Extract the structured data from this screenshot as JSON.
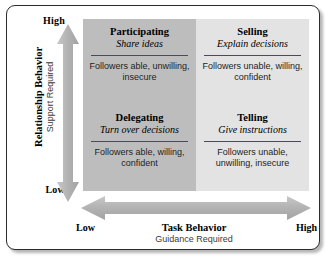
{
  "diagram": {
    "colors": {
      "quadrant_dark": "#bdbdbd",
      "quadrant_light": "#e3e3e3",
      "arrow_fill": "#b0b0b0",
      "rule": "#4a4a5a",
      "frame_border": "#2b2b2b",
      "text": "#000000"
    }
  },
  "y_axis": {
    "high_label": "High",
    "low_label": "Low",
    "caption_main": "Relationship Behavior",
    "caption_sub": "Support Required",
    "arrow_icon": "double-headed-vertical-arrow"
  },
  "x_axis": {
    "low_label": "Low",
    "high_label": "High",
    "caption_main": "Task Behavior",
    "caption_sub": "Guidance Required",
    "arrow_icon": "double-headed-horizontal-arrow"
  },
  "quadrants": [
    {
      "key": "participating",
      "title": "Participating",
      "subtitle": "Share ideas",
      "description": "Followers able, unwilling, insecure",
      "shade": "dark"
    },
    {
      "key": "selling",
      "title": "Selling",
      "subtitle": "Explain decisions",
      "description": "Followers unable, willing, confident",
      "shade": "light"
    },
    {
      "key": "delegating",
      "title": "Delegating",
      "subtitle": "Turn over decisions",
      "description": "Followers able, willing, confident",
      "shade": "dark"
    },
    {
      "key": "telling",
      "title": "Telling",
      "subtitle": "Give instructions",
      "description": "Followers unable, unwilling, insecure",
      "shade": "light"
    }
  ]
}
